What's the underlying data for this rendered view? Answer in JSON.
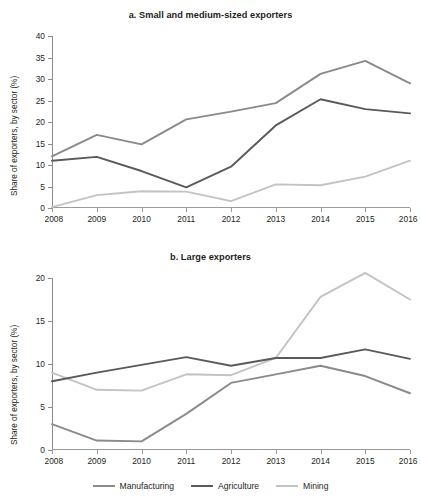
{
  "figure": {
    "cut_off_header": "",
    "legend_position": "bottom",
    "colors": {
      "manufacturing": "#8a8a8a",
      "agriculture": "#5a5a5a",
      "mining": "#c3c3c3",
      "axis": "#8c8c8c",
      "text": "#231f20"
    },
    "legend": [
      {
        "label": "Manufacturing",
        "color": "#8a8a8a",
        "icon": "line-swatch"
      },
      {
        "label": "Agriculture",
        "color": "#5a5a5a",
        "icon": "line-swatch"
      },
      {
        "label": "Mining",
        "color": "#c3c3c3",
        "icon": "line-swatch"
      }
    ]
  },
  "chart_data": [
    {
      "type": "line",
      "title": "a. Small and medium-sized exporters",
      "xlabel": "",
      "ylabel": "Share of exporters, by sector (%)",
      "x": [
        "2008",
        "2009",
        "2010",
        "2011",
        "2012",
        "2013",
        "2014",
        "2015",
        "2016"
      ],
      "xticklabels": [
        "2008",
        "2009",
        "2010",
        "2011",
        "2012",
        "2013",
        "2014",
        "2015",
        "2016"
      ],
      "yticklabels": [
        "0",
        "5",
        "10",
        "15",
        "20",
        "25",
        "30",
        "35",
        "40"
      ],
      "yticks": [
        0,
        5,
        10,
        15,
        20,
        25,
        30,
        35,
        40
      ],
      "ylim": [
        0,
        40
      ],
      "grid": false,
      "series": [
        {
          "name": "Manufacturing",
          "color": "#8a8a8a",
          "values": [
            12.0,
            17.0,
            14.8,
            20.6,
            22.4,
            24.4,
            31.2,
            34.2,
            29.0
          ]
        },
        {
          "name": "Agriculture",
          "color": "#5a5a5a",
          "values": [
            11.0,
            11.9,
            8.6,
            4.8,
            9.6,
            19.2,
            25.3,
            23.0,
            22.0
          ]
        },
        {
          "name": "Mining",
          "color": "#c3c3c3",
          "values": [
            0.2,
            3.0,
            3.9,
            3.8,
            1.6,
            5.5,
            5.3,
            7.3,
            11.0
          ]
        }
      ]
    },
    {
      "type": "line",
      "title": "b. Large exporters",
      "xlabel": "",
      "ylabel": "Share of exporters, by sector (%)",
      "x": [
        "2008",
        "2009",
        "2010",
        "2011",
        "2012",
        "2013",
        "2014",
        "2015",
        "2016"
      ],
      "xticklabels": [
        "2008",
        "2009",
        "2010",
        "2011",
        "2012",
        "2013",
        "2014",
        "2015",
        "2016"
      ],
      "yticklabels": [
        "0",
        "5",
        "10",
        "15",
        "20"
      ],
      "yticks": [
        0,
        5,
        10,
        15,
        20
      ],
      "ylim": [
        0,
        20
      ],
      "grid": false,
      "series": [
        {
          "name": "Manufacturing",
          "color": "#8a8a8a",
          "values": [
            3.0,
            1.1,
            1.0,
            4.2,
            7.8,
            8.8,
            9.8,
            8.6,
            6.6
          ]
        },
        {
          "name": "Agriculture",
          "color": "#5a5a5a",
          "values": [
            8.0,
            9.0,
            9.9,
            10.8,
            9.8,
            10.7,
            10.7,
            11.7,
            10.6
          ]
        },
        {
          "name": "Mining",
          "color": "#c3c3c3",
          "values": [
            9.0,
            7.0,
            6.9,
            8.8,
            8.7,
            10.7,
            17.8,
            20.6,
            17.5
          ]
        }
      ]
    }
  ]
}
